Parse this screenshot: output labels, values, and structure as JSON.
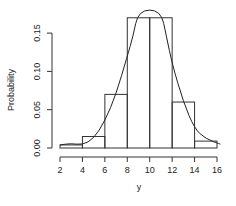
{
  "chart_data": {
    "type": "bar",
    "subtype": "histogram_with_density_curve",
    "title": "",
    "xlabel": "y",
    "ylabel": "Probability",
    "bins": [
      [
        2,
        4
      ],
      [
        4,
        6
      ],
      [
        6,
        8
      ],
      [
        8,
        10
      ],
      [
        10,
        12
      ],
      [
        12,
        14
      ],
      [
        14,
        16
      ]
    ],
    "categories": [
      "2-4",
      "4-6",
      "6-8",
      "8-10",
      "10-12",
      "12-14",
      "14-16"
    ],
    "values": [
      0.004,
      0.015,
      0.07,
      0.17,
      0.17,
      0.06,
      0.009
    ],
    "x_ticks": [
      2,
      4,
      6,
      8,
      10,
      12,
      14,
      16
    ],
    "x_tick_labels": [
      "2",
      "4",
      "6",
      "8",
      "10",
      "12",
      "14",
      "16"
    ],
    "y_ticks": [
      0.0,
      0.05,
      0.1,
      0.15
    ],
    "y_tick_labels": [
      "0.00",
      "0.05",
      "0.10",
      "0.15"
    ],
    "xlim": [
      2,
      16
    ],
    "ylim": [
      0,
      0.17
    ],
    "grid": false,
    "legend": null,
    "curve": {
      "name": "density",
      "x": [
        2,
        3,
        4,
        5,
        6,
        7,
        8,
        8.5,
        9.0,
        11.0,
        11.5,
        12,
        13,
        14,
        15,
        16.3
      ],
      "y": [
        0.004,
        0.006,
        0.004,
        0.012,
        0.035,
        0.07,
        0.12,
        0.145,
        0.18,
        0.18,
        0.145,
        0.11,
        0.06,
        0.025,
        0.012,
        0.005
      ]
    }
  }
}
